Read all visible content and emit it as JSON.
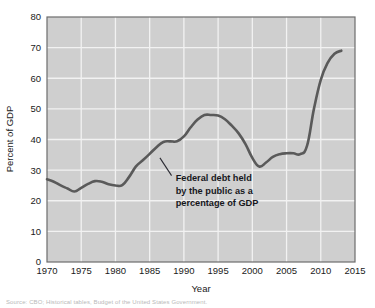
{
  "chart_data": {
    "type": "line",
    "title": "",
    "xlabel": "Year",
    "ylabel": "Percent of GDP",
    "xlim": [
      1970,
      2015
    ],
    "ylim": [
      0,
      80
    ],
    "xticks": [
      1970,
      1975,
      1980,
      1985,
      1990,
      1995,
      2000,
      2005,
      2010,
      2015
    ],
    "yticks": [
      0,
      10,
      20,
      30,
      40,
      50,
      60,
      70,
      80
    ],
    "grid": "both",
    "legend": "none",
    "plot_background": "#cfcfcf",
    "gridline_color": "#f2f2f2",
    "line_color": "#5a5a5a",
    "series": [
      {
        "name": "Federal debt held by the public as a percentage of GDP",
        "x": [
          1970,
          1971,
          1972,
          1973,
          1974,
          1975,
          1976,
          1977,
          1978,
          1979,
          1980,
          1981,
          1982,
          1983,
          1984,
          1985,
          1986,
          1987,
          1988,
          1989,
          1990,
          1991,
          1992,
          1993,
          1994,
          1995,
          1996,
          1997,
          1998,
          1999,
          2000,
          2001,
          2002,
          2003,
          2004,
          2005,
          2006,
          2007,
          2008,
          2009,
          2010,
          2011,
          2012,
          2013
        ],
        "values": [
          27.0,
          26.2,
          25.0,
          24.0,
          23.0,
          24.2,
          25.5,
          26.4,
          26.2,
          25.4,
          25.0,
          25.1,
          27.8,
          31.2,
          33.2,
          35.3,
          37.5,
          39.2,
          39.4,
          39.4,
          41.0,
          44.0,
          46.5,
          48.0,
          48.0,
          47.8,
          46.6,
          44.5,
          42.0,
          38.5,
          34.0,
          31.2,
          32.5,
          34.3,
          35.2,
          35.5,
          35.5,
          35.2,
          38.0,
          50.0,
          59.5,
          65.0,
          68.0,
          69.0
        ]
      }
    ],
    "annotation": {
      "lines": [
        "Federal debt held",
        "by the public as a",
        "percentage of GDP"
      ],
      "pointer_from": [
        1986.5,
        34.0
      ],
      "pointer_to": [
        1988.2,
        28.2
      ]
    }
  },
  "source_note": "Source: CBO; Historical tables, Budget of the United States Government."
}
